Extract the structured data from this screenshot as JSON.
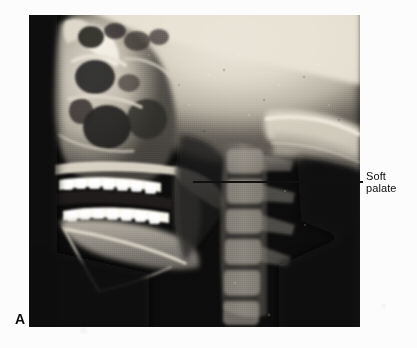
{
  "figure": {
    "panel_letter": "A",
    "modality": "lateral cephalometric radiograph",
    "background_color": "#fcfcfc"
  },
  "radiograph": {
    "name": "lateral-cephalometric-radiograph",
    "frame": {
      "x": 29,
      "y": 15,
      "width": 331,
      "height": 312
    },
    "film_background_color": "#0a0a0a",
    "bone_bright_color": "#f0ece2",
    "soft_tissue_color": "#8d8a82",
    "air_dark_color": "#141414",
    "anatomy_visible": [
      "cranial base",
      "frontal sinus",
      "orbit",
      "nasal cavity",
      "maxillary sinus",
      "hard palate",
      "maxillary teeth",
      "mandibular teeth",
      "mandible",
      "soft palate",
      "nasopharyngeal airway",
      "oropharyngeal airway",
      "cervical vertebrae",
      "occipital bone"
    ]
  },
  "annotation": {
    "label_text_line1": "Soft",
    "label_text_line2": "palate",
    "leader_line": {
      "name": "soft-palate-leader-line",
      "x_start": 193,
      "x_end": 363,
      "y": 181,
      "color": "#101010",
      "thickness_px": 2
    },
    "label_position": {
      "x": 366,
      "y": 170
    },
    "text_color": "#0d0d0d"
  }
}
